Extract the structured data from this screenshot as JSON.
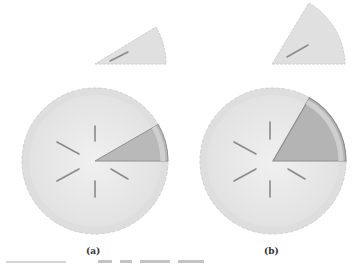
{
  "figure": {
    "panels": [
      {
        "id": "a",
        "label": "(a)",
        "slice_angle_deg": 30
      },
      {
        "id": "b",
        "label": "(b)",
        "slice_angle_deg": 60
      }
    ],
    "colors": {
      "crust": "#e4e4e4",
      "crust_edge": "#d2d2d2",
      "filling": "#ececec",
      "slice": "#b4b4b4",
      "slice_edge": "#8e8e8e",
      "vent": "#8a8a8a"
    }
  }
}
